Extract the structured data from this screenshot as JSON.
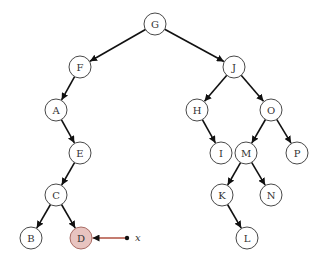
{
  "diagram": {
    "type": "binary-tree",
    "node_radius": 11,
    "colors": {
      "node_fill": "#ffffff",
      "node_stroke": "#333333",
      "highlight_fill": "#e8c4c0",
      "highlight_stroke": "#a06058",
      "edge": "#111111",
      "pointer_line": "#b05040"
    },
    "nodes": [
      {
        "id": "G",
        "label": "G",
        "x": 155,
        "y": 24
      },
      {
        "id": "F",
        "label": "F",
        "x": 80,
        "y": 67
      },
      {
        "id": "A",
        "label": "A",
        "x": 56,
        "y": 110
      },
      {
        "id": "E",
        "label": "E",
        "x": 80,
        "y": 153
      },
      {
        "id": "C",
        "label": "C",
        "x": 56,
        "y": 195
      },
      {
        "id": "B",
        "label": "B",
        "x": 31,
        "y": 238
      },
      {
        "id": "D",
        "label": "D",
        "x": 81,
        "y": 238,
        "highlight": true
      },
      {
        "id": "J",
        "label": "J",
        "x": 234,
        "y": 67
      },
      {
        "id": "H",
        "label": "H",
        "x": 197,
        "y": 110
      },
      {
        "id": "O",
        "label": "O",
        "x": 271,
        "y": 110
      },
      {
        "id": "I",
        "label": "I",
        "x": 221,
        "y": 153
      },
      {
        "id": "M",
        "label": "M",
        "x": 246,
        "y": 153
      },
      {
        "id": "P",
        "label": "P",
        "x": 297,
        "y": 153
      },
      {
        "id": "K",
        "label": "K",
        "x": 222,
        "y": 195
      },
      {
        "id": "N",
        "label": "N",
        "x": 271,
        "y": 195
      },
      {
        "id": "L",
        "label": "L",
        "x": 247,
        "y": 238
      }
    ],
    "edges": [
      [
        "G",
        "F"
      ],
      [
        "G",
        "J"
      ],
      [
        "F",
        "A"
      ],
      [
        "A",
        "E"
      ],
      [
        "E",
        "C"
      ],
      [
        "C",
        "B"
      ],
      [
        "C",
        "D"
      ],
      [
        "J",
        "H"
      ],
      [
        "J",
        "O"
      ],
      [
        "H",
        "I"
      ],
      [
        "O",
        "M"
      ],
      [
        "O",
        "P"
      ],
      [
        "M",
        "K"
      ],
      [
        "M",
        "N"
      ],
      [
        "K",
        "L"
      ]
    ],
    "pointer": {
      "label": "x",
      "target": "D",
      "x": 127,
      "y": 238
    }
  }
}
